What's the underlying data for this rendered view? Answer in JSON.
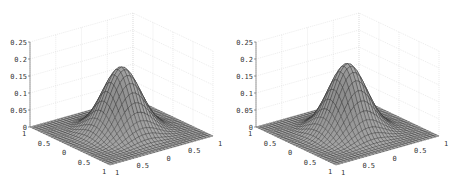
{
  "chart_data": [
    {
      "type": "surface",
      "title": "",
      "xlabel": "",
      "ylabel": "",
      "zlabel": "",
      "x_range": [
        -1,
        1
      ],
      "y_range": [
        -1,
        1
      ],
      "zlim": [
        0,
        0.25
      ],
      "z_ticks": [
        "0",
        "0.05",
        "0.1",
        "0.15",
        "0.2",
        "0.25"
      ],
      "x_ticks": [
        "1",
        "0.5",
        "0",
        "0.5",
        "1"
      ],
      "y_ticks": [
        "1",
        "0.5",
        "0",
        "0.5",
        "1"
      ],
      "peak": {
        "x": 0,
        "y": 0,
        "z": 0.19
      },
      "function": "gaussian bump, zero at domain boundary",
      "grid": true,
      "mesh_resolution": 30,
      "colormap": "gray"
    },
    {
      "type": "surface",
      "title": "",
      "xlabel": "",
      "ylabel": "",
      "zlabel": "",
      "x_range": [
        -1,
        1
      ],
      "y_range": [
        -1,
        1
      ],
      "zlim": [
        0,
        0.25
      ],
      "z_ticks": [
        "0",
        "0.05",
        "0.1",
        "0.15",
        "0.2",
        "0.25"
      ],
      "x_ticks": [
        "1",
        "0.5",
        "0",
        "0.5",
        "1"
      ],
      "y_ticks": [
        "1",
        "0.5",
        "0",
        "0.5",
        "1"
      ],
      "peak": {
        "x": 0,
        "y": 0,
        "z": 0.2
      },
      "function": "gaussian bump, zero at domain boundary",
      "grid": true,
      "mesh_resolution": 30,
      "colormap": "gray"
    }
  ]
}
